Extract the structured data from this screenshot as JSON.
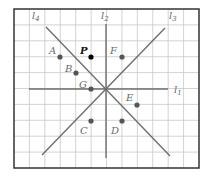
{
  "figure": {
    "frame": {
      "x": 14,
      "y": 9,
      "width": 185,
      "height": 159
    },
    "grid": {
      "columns": 12,
      "rows": 10,
      "line_color": "#c8c8c8",
      "border_color": "#333333"
    },
    "origin": {
      "x": 106,
      "y": 89
    }
  },
  "lines": [
    {
      "id": "l1",
      "label": "l",
      "subscript": "1",
      "x1": 29,
      "y1": 89,
      "x2": 168,
      "y2": 89,
      "label_x": 174,
      "label_y": 93
    },
    {
      "id": "l2",
      "label": "l",
      "subscript": "2",
      "x1": 106,
      "y1": 24,
      "x2": 106,
      "y2": 158,
      "label_x": 101,
      "label_y": 19
    },
    {
      "id": "l3",
      "label": "l",
      "subscript": "3",
      "x1": 42,
      "y1": 155,
      "x2": 165,
      "y2": 28,
      "label_x": 169,
      "label_y": 19
    },
    {
      "id": "l4",
      "label": "l",
      "subscript": "4",
      "x1": 46,
      "y1": 27,
      "x2": 170,
      "y2": 156,
      "label_x": 32,
      "label_y": 19
    }
  ],
  "points": [
    {
      "name": "A",
      "x": 60,
      "y": 57,
      "label_x": 49,
      "label_y": 54,
      "highlight": false
    },
    {
      "name": "P",
      "x": 91,
      "y": 57,
      "label_x": 80,
      "label_y": 54,
      "highlight": true
    },
    {
      "name": "F",
      "x": 122,
      "y": 57,
      "label_x": 110,
      "label_y": 54,
      "highlight": false
    },
    {
      "name": "B",
      "x": 76,
      "y": 73,
      "label_x": 65,
      "label_y": 72,
      "highlight": false
    },
    {
      "name": "G",
      "x": 91,
      "y": 89,
      "label_x": 79,
      "label_y": 88,
      "highlight": false
    },
    {
      "name": "E",
      "x": 137,
      "y": 105,
      "label_x": 126,
      "label_y": 101,
      "highlight": false
    },
    {
      "name": "C",
      "x": 91,
      "y": 121,
      "label_x": 80,
      "label_y": 134,
      "highlight": false
    },
    {
      "name": "D",
      "x": 122,
      "y": 121,
      "label_x": 111,
      "label_y": 134,
      "highlight": false
    }
  ],
  "colors": {
    "line": "#6e6e6e",
    "point": "#555555",
    "highlight_point": "#000000"
  }
}
